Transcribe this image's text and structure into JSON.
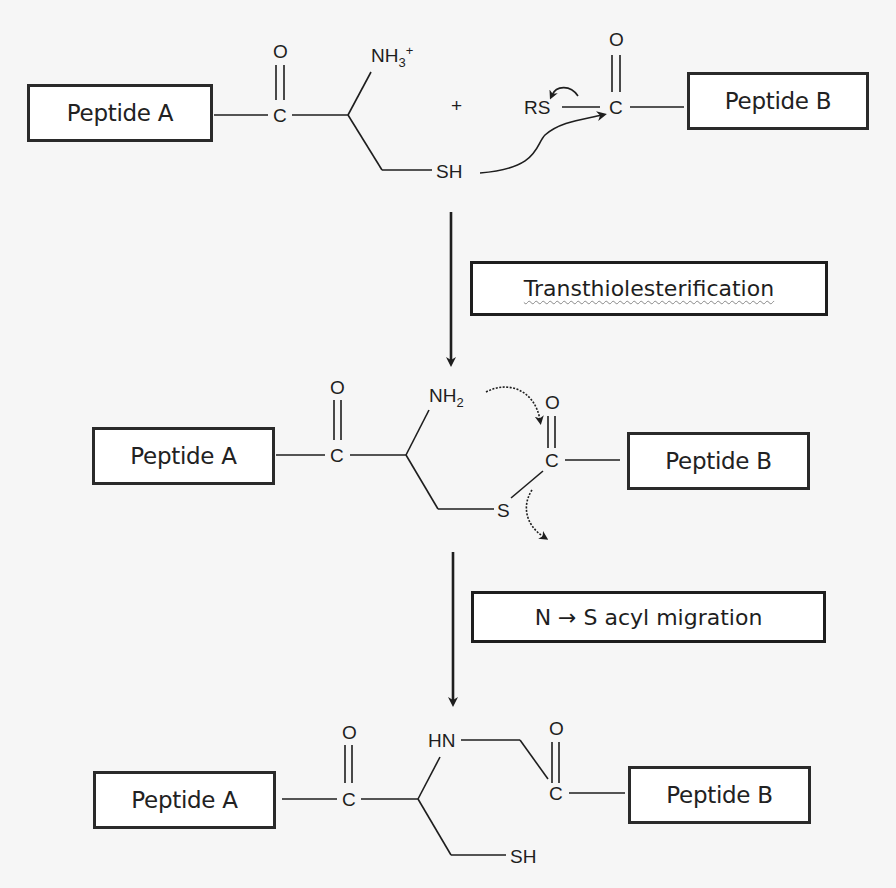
{
  "figure": {
    "colors": {
      "background": "#f6f6f6",
      "ink": "#1e1e1e",
      "box_fill": "#ffffff"
    }
  },
  "stage1": {
    "peptide_a": "Peptide A",
    "peptide_b": "Peptide B",
    "carbonyl_o": "O",
    "carbonyl_c": "C",
    "amine": "NH",
    "amine_sub": "3",
    "amine_sup": "+",
    "thiol": "SH",
    "plus": "+",
    "thioester_rs": "RS",
    "b_carbonyl_o": "O",
    "b_carbonyl_c": "C"
  },
  "step1": {
    "label": "Transthiolesterification"
  },
  "stage2": {
    "peptide_a": "Peptide A",
    "peptide_b": "Peptide B",
    "carbonyl_o": "O",
    "carbonyl_c": "C",
    "amine": "NH",
    "amine_sub": "2",
    "sulfur": "S",
    "b_carbonyl_o": "O",
    "b_carbonyl_c": "C"
  },
  "step2": {
    "label": "N → S acyl migration"
  },
  "stage3": {
    "peptide_a": "Peptide A",
    "peptide_b": "Peptide B",
    "carbonyl_o": "O",
    "carbonyl_c": "C",
    "amide_n": "HN",
    "thiol": "SH",
    "b_carbonyl_o": "O",
    "b_carbonyl_c": "C"
  }
}
